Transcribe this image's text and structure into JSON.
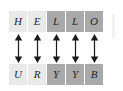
{
  "diagram": {
    "type": "substitution-cipher-mapping",
    "colors": {
      "background": "#ffffff",
      "cell_light": "#e9e9e9",
      "cell_dark": "#a9a9a9",
      "letter_text": "#26262a",
      "arrow": "#1a1a1a"
    },
    "plaintext": {
      "word": "HELLO",
      "cells": [
        {
          "letter": "H",
          "shade": "light"
        },
        {
          "letter": "E",
          "shade": "light"
        },
        {
          "letter": "L",
          "shade": "dark"
        },
        {
          "letter": "L",
          "shade": "dark"
        },
        {
          "letter": "O",
          "shade": "dark"
        }
      ]
    },
    "ciphertext": {
      "word": "URYYB",
      "cells": [
        {
          "letter": "U",
          "shade": "light"
        },
        {
          "letter": "R",
          "shade": "light"
        },
        {
          "letter": "Y",
          "shade": "dark"
        },
        {
          "letter": "Y",
          "shade": "dark"
        },
        {
          "letter": "B",
          "shade": "dark"
        }
      ]
    },
    "connectors": {
      "icon": "double-headed-vertical-arrow",
      "count": 5,
      "pairs": [
        "H-U",
        "E-R",
        "L-Y",
        "L-Y",
        "O-B"
      ]
    }
  }
}
